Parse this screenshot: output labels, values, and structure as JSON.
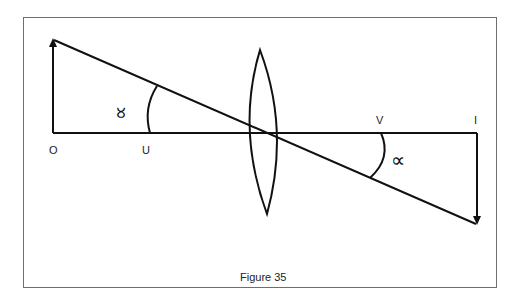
{
  "figure": {
    "caption": "Figure 35",
    "colors": {
      "line": "#111111",
      "frame": "#6e6e6e",
      "background": "#ffffff"
    }
  },
  "labels": {
    "object_point": "O",
    "object_distance_marker": "U",
    "image_distance_marker": "V",
    "image_point": "I"
  },
  "angles": {
    "left_symbol": "∝",
    "right_symbol": "∝"
  },
  "elements": {
    "object_arrow": "upright object arrow at O",
    "image_arrow": "inverted image arrow at I",
    "lens": "convex lens",
    "principal_axis": "principal axis O to I",
    "ray": "ray through optical centre"
  }
}
